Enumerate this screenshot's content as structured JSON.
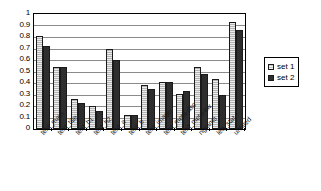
{
  "chart_data": {
    "type": "bar",
    "title": "",
    "xlabel": "",
    "ylabel": "",
    "ylim": [
      0,
      1
    ],
    "yticks": [
      "0",
      "0.1",
      "0.2",
      "0.3",
      "0.4",
      "0.5",
      "0.6",
      "0.7",
      "0.8",
      "0.9",
      "1"
    ],
    "ytick_values": [
      0,
      0.1,
      0.2,
      0.3,
      0.4,
      0.5,
      0.6,
      0.7,
      0.8,
      0.9,
      1
    ],
    "grid": true,
    "legend_position": "right",
    "categories": [
      "text_main",
      "text_title",
      "text_h1",
      "text_h2",
      "text_a",
      "text_b",
      "text_image",
      "text_meta-dsc",
      "text_meta-kw",
      "ngrams",
      "leq_stat",
      "untitled"
    ],
    "series": [
      {
        "name": "set 1",
        "color": "#b3b3b3",
        "values": [
          0.81,
          0.54,
          0.26,
          0.2,
          0.7,
          0.12,
          0.38,
          0.41,
          0.305,
          0.54,
          0.435,
          0.93
        ]
      },
      {
        "name": "set 2",
        "color": "#2e2e2e",
        "values": [
          0.72,
          0.54,
          0.23,
          0.16,
          0.6,
          0.125,
          0.345,
          0.41,
          0.33,
          0.475,
          0.3,
          0.865
        ]
      }
    ]
  },
  "legend": {
    "entries": [
      {
        "label": "set 1"
      },
      {
        "label": "set 2"
      }
    ]
  }
}
